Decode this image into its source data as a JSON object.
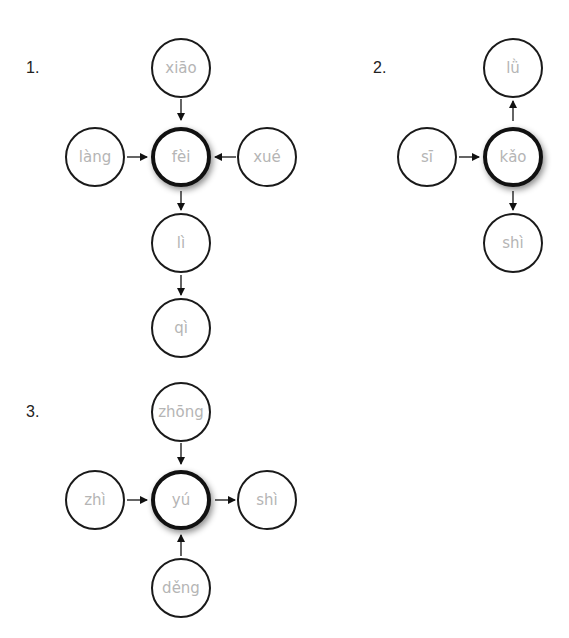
{
  "diagrams": [
    {
      "label": "1.",
      "center": "fèi",
      "top": "xiāo",
      "left": "làng",
      "right": "xué",
      "below1": "lì",
      "below2": "qì"
    },
    {
      "label": "2.",
      "center": "kǎo",
      "top": "lǜ",
      "left": "sī",
      "bottom": "shì"
    },
    {
      "label": "3.",
      "center": "yú",
      "top": "zhōng",
      "left": "zhì",
      "right": "shì",
      "bottom": "děng"
    }
  ],
  "colors": {
    "circle_border": "#1a1a1a",
    "text": "#b5b5b5",
    "arrow": "#111111"
  }
}
